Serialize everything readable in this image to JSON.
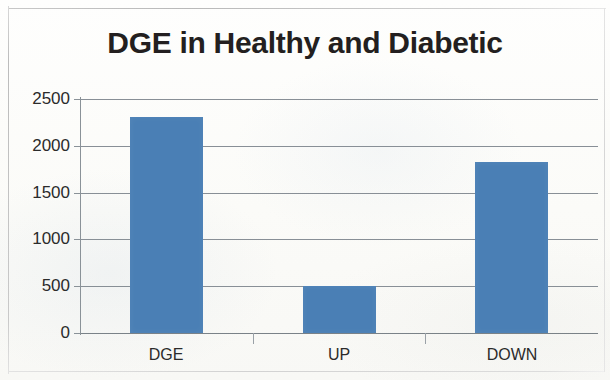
{
  "chart_data": {
    "type": "bar",
    "title": "DGE in Healthy and Diabetic",
    "categories": [
      "DGE",
      "UP",
      "DOWN"
    ],
    "values": [
      2310,
      505,
      1830
    ],
    "xlabel": "",
    "ylabel": "",
    "ylim": [
      0,
      2500
    ],
    "yticks": [
      0,
      500,
      1000,
      1500,
      2000,
      2500
    ],
    "ytick_labels": [
      "0",
      "500",
      "1000",
      "1500",
      "2000",
      "2500"
    ],
    "grid": true,
    "legend": false,
    "legend_position": "none",
    "series": [
      {
        "name": "DGE counts",
        "values": [
          2310,
          505,
          1830
        ],
        "color": "#4a7fb5"
      }
    ]
  },
  "style": {
    "bar_color": "#4a7fb5",
    "grid_color": "#7e868d",
    "axis_color": "#8a9298",
    "title_color": "#231f20",
    "label_color": "#2b2b2b",
    "background": "#fdfdfa"
  }
}
